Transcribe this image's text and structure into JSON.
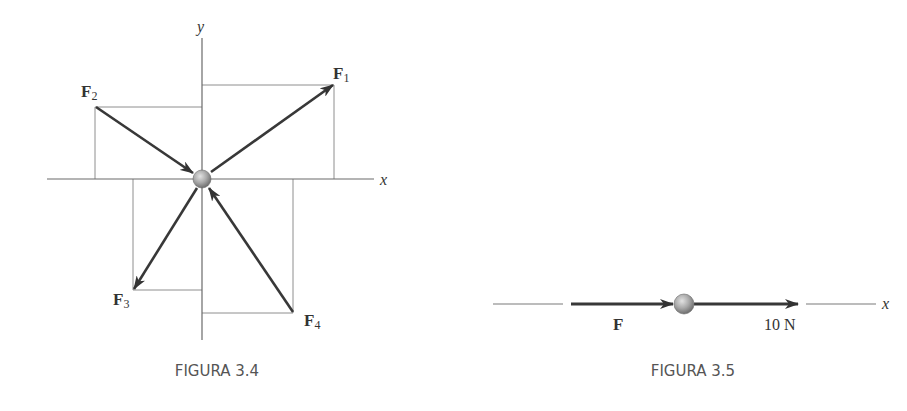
{
  "figures": [
    {
      "caption": "FIGURA 3.4",
      "axes": {
        "x_label": "x",
        "y_label": "y"
      },
      "particle": "center-particle",
      "forces": [
        {
          "name": "F",
          "subscript": "1",
          "direction": "up-right",
          "sense": "away"
        },
        {
          "name": "F",
          "subscript": "2",
          "direction": "up-left",
          "sense": "toward"
        },
        {
          "name": "F",
          "subscript": "3",
          "direction": "down-left",
          "sense": "away"
        },
        {
          "name": "F",
          "subscript": "4",
          "direction": "down-right",
          "sense": "toward"
        }
      ]
    },
    {
      "caption": "FIGURA 3.5",
      "axis_label": "x",
      "forces": [
        {
          "name": "F",
          "label": "F",
          "sense": "toward"
        },
        {
          "name": "10N",
          "label": "10 N",
          "sense": "away"
        }
      ]
    }
  ],
  "colors": {
    "arrow": "#3a3a3a",
    "guide_line": "#8a8a8a",
    "axis": "#6a6a6a",
    "particle": "#a8a8a8",
    "caption": "#555555"
  }
}
